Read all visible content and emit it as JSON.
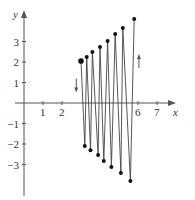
{
  "chart_data": {
    "type": "line",
    "title": "",
    "xlabel": "x",
    "ylabel": "y",
    "xlim": [
      0,
      7.5
    ],
    "ylim": [
      -4,
      4
    ],
    "grid": false,
    "x_ticks": [
      1,
      2,
      6,
      7
    ],
    "y_ticks": [
      3,
      2,
      1,
      -1,
      -2,
      -3
    ],
    "x_tick_labels": [
      "1",
      "2",
      "6",
      "7"
    ],
    "y_tick_labels": [
      "3",
      "2",
      "1",
      "−1",
      "−2",
      "−3"
    ],
    "series": [
      {
        "name": "oscillating path",
        "points": [
          [
            3.0,
            2.05
          ],
          [
            3.2,
            -2.1
          ],
          [
            3.3,
            2.24
          ],
          [
            3.5,
            -2.3
          ],
          [
            3.6,
            2.49
          ],
          [
            3.9,
            -2.54
          ],
          [
            4.0,
            2.73
          ],
          [
            4.2,
            -2.83
          ],
          [
            4.4,
            3.02
          ],
          [
            4.6,
            -3.12
          ],
          [
            4.8,
            3.37
          ],
          [
            5.1,
            -3.41
          ],
          [
            5.2,
            3.66
          ],
          [
            5.6,
            -3.8
          ],
          [
            5.8,
            4.1
          ]
        ]
      }
    ],
    "start_point": [
      3.0,
      2.05
    ],
    "annotations": [
      {
        "type": "arrow",
        "direction": "down",
        "x": 2.75,
        "y": 0.9
      },
      {
        "type": "arrow",
        "direction": "up",
        "x": 6.05,
        "y": 2.0
      }
    ],
    "legend": null
  },
  "axes": {
    "x_label": "x",
    "y_label": "y",
    "x_ticks": [
      {
        "value": 1,
        "label": "1"
      },
      {
        "value": 2,
        "label": "2"
      },
      {
        "value": 6,
        "label": "6"
      },
      {
        "value": 7,
        "label": "7"
      }
    ],
    "y_ticks": [
      {
        "value": 3,
        "label": "3"
      },
      {
        "value": 2,
        "label": "2"
      },
      {
        "value": 1,
        "label": "1"
      },
      {
        "value": -1,
        "label": "−1"
      },
      {
        "value": -2,
        "label": "−2"
      },
      {
        "value": -3,
        "label": "−3"
      }
    ]
  },
  "colors": {
    "axis": "#555555",
    "line": "#444444",
    "point": "#111111"
  }
}
